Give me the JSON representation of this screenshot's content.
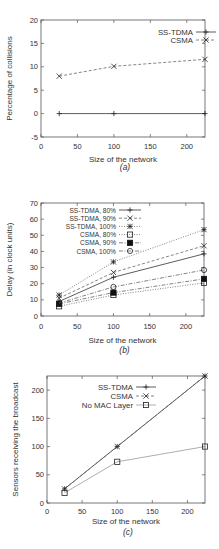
{
  "chart_data": [
    {
      "id": "a",
      "type": "line",
      "caption": "(a)",
      "title": "",
      "xlabel": "Size of the network",
      "ylabel": "Percentage of collisions",
      "xlim": [
        0,
        225
      ],
      "ylim": [
        -5,
        20
      ],
      "xticks": [
        0,
        50,
        100,
        150,
        200
      ],
      "yticks": [
        -5,
        0,
        5,
        10,
        15,
        20
      ],
      "grid": false,
      "legend_position": "top-right",
      "x": [
        25,
        100,
        225
      ],
      "series": [
        {
          "name": "SS-TDMA",
          "values": [
            0,
            0,
            0
          ],
          "marker": "plus",
          "dash": "solid"
        },
        {
          "name": "CSMA",
          "values": [
            8,
            10.1,
            11.6
          ],
          "marker": "x",
          "dash": "dashed"
        }
      ]
    },
    {
      "id": "b",
      "type": "line",
      "caption": "(b)",
      "title": "",
      "xlabel": "Size of the network",
      "ylabel": "Delay (in clock units)",
      "xlim": [
        0,
        225
      ],
      "ylim": [
        0,
        70
      ],
      "xticks": [
        0,
        50,
        100,
        150,
        200
      ],
      "yticks": [
        0,
        10,
        20,
        30,
        40,
        50,
        60,
        70
      ],
      "grid": false,
      "legend_position": "top-left",
      "x": [
        25,
        100,
        225
      ],
      "series": [
        {
          "name": "SS-TDMA, 80%",
          "values": [
            9,
            24,
            38.5
          ],
          "marker": "plus",
          "dash": "solid"
        },
        {
          "name": "SS-TDMA, 90%",
          "values": [
            11,
            27,
            43.5
          ],
          "marker": "x",
          "dash": "dashed"
        },
        {
          "name": "SS-TDMA, 100%",
          "values": [
            13,
            33.5,
            53.5
          ],
          "marker": "star",
          "dash": "dotted"
        },
        {
          "name": "CSMA, 80%",
          "values": [
            6,
            13,
            20.5
          ],
          "marker": "square-open",
          "dash": "dotted"
        },
        {
          "name": "CSMA, 90%",
          "values": [
            7.5,
            14.5,
            23
          ],
          "marker": "square-filled",
          "dash": "dashdot"
        },
        {
          "name": "CSMA, 100%",
          "values": [
            8,
            18,
            28.5
          ],
          "marker": "circle-open",
          "dash": "dashdot"
        }
      ]
    },
    {
      "id": "c",
      "type": "line",
      "caption": "(c)",
      "title": "",
      "xlabel": "Size of the network",
      "ylabel": "Sensors receiving the broadcast",
      "xlim": [
        0,
        225
      ],
      "ylim": [
        0,
        225
      ],
      "xticks": [
        0,
        50,
        100,
        150,
        200
      ],
      "yticks": [
        0,
        50,
        100,
        150,
        200
      ],
      "grid": false,
      "legend_position": "top-left",
      "x": [
        25,
        100,
        225
      ],
      "series": [
        {
          "name": "SS-TDMA",
          "values": [
            25,
            100,
            225
          ],
          "marker": "plus",
          "dash": "solid"
        },
        {
          "name": "CSMA",
          "values": [
            25,
            100,
            225
          ],
          "marker": "x",
          "dash": "dashed"
        },
        {
          "name": "No MAC Layer",
          "values": [
            18,
            73,
            100
          ],
          "marker": "square-open",
          "dash": "solid-light"
        }
      ]
    }
  ],
  "colors": {
    "axis": "#555555",
    "series_dark": "#333333",
    "series_mid": "#666666",
    "series_light": "#999999"
  }
}
